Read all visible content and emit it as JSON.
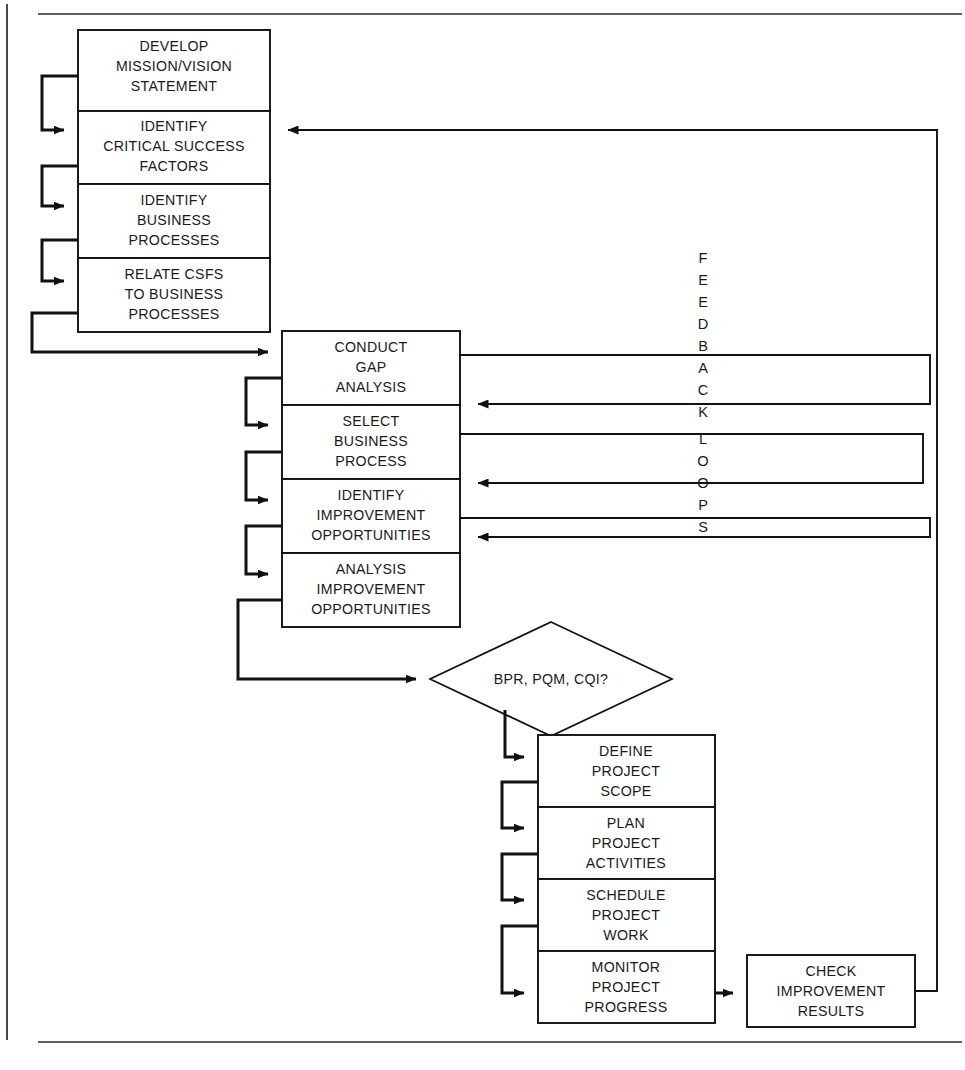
{
  "page": {
    "width": 965,
    "height": 1070,
    "background_color": "#ffffff",
    "line_color": "#111111",
    "text_color": "#1a1a1a"
  },
  "frame": {
    "left_rule_name": "left-vertical-rule",
    "top_rule_name": "top-horizontal-rule",
    "bottom_rule_name": "bottom-horizontal-rule"
  },
  "stage1": {
    "name": "strategic-planning-stage",
    "boxes": [
      {
        "id": "develop-mission-vision-statement",
        "lines": [
          "DEVELOP",
          "MISSION/VISION",
          "STATEMENT"
        ]
      },
      {
        "id": "identify-critical-success-factors",
        "lines": [
          "IDENTIFY",
          "CRITICAL SUCCESS",
          "FACTORS"
        ]
      },
      {
        "id": "identify-business-processes",
        "lines": [
          "IDENTIFY",
          "BUSINESS",
          "PROCESSES"
        ]
      },
      {
        "id": "relate-csfs-to-business-processes",
        "lines": [
          "RELATE CSFS",
          "TO BUSINESS",
          "PROCESSES"
        ]
      }
    ]
  },
  "stage2": {
    "name": "gap-analysis-stage",
    "boxes": [
      {
        "id": "conduct-gap-analysis",
        "lines": [
          "CONDUCT",
          "GAP",
          "ANALYSIS"
        ]
      },
      {
        "id": "select-business-process",
        "lines": [
          "SELECT",
          "BUSINESS",
          "PROCESS"
        ]
      },
      {
        "id": "identify-improvement-opportunities",
        "lines": [
          "IDENTIFY",
          "IMPROVEMENT",
          "OPPORTUNITIES"
        ]
      },
      {
        "id": "analysis-improvement-opportunities",
        "lines": [
          "ANALYSIS",
          "IMPROVEMENT",
          "OPPORTUNITIES"
        ]
      }
    ]
  },
  "decision": {
    "id": "bpr-pqm-cqi-decision",
    "label": "BPR, PQM, CQI?"
  },
  "stage3": {
    "name": "project-management-stage",
    "boxes": [
      {
        "id": "define-project-scope",
        "lines": [
          "DEFINE",
          "PROJECT",
          "SCOPE"
        ]
      },
      {
        "id": "plan-project-activities",
        "lines": [
          "PLAN",
          "PROJECT",
          "ACTIVITIES"
        ]
      },
      {
        "id": "schedule-project-work",
        "lines": [
          "SCHEDULE",
          "PROJECT",
          "WORK"
        ]
      },
      {
        "id": "monitor-project-progress",
        "lines": [
          "MONITOR",
          "PROJECT",
          "PROGRESS"
        ]
      }
    ]
  },
  "check": {
    "id": "check-improvement-results",
    "lines": [
      "CHECK",
      "IMPROVEMENT",
      "RESULTS"
    ]
  },
  "feedback": {
    "name": "feedback-loops-label",
    "text": "FEEDBACK LOOPS",
    "letters": [
      "F",
      "E",
      "E",
      "D",
      "B",
      "A",
      "C",
      "K",
      "L",
      "O",
      "O",
      "P",
      "S"
    ],
    "letter_y": [
      263,
      285,
      307,
      329,
      351,
      373,
      395,
      417,
      444,
      466,
      488,
      510,
      532
    ]
  }
}
